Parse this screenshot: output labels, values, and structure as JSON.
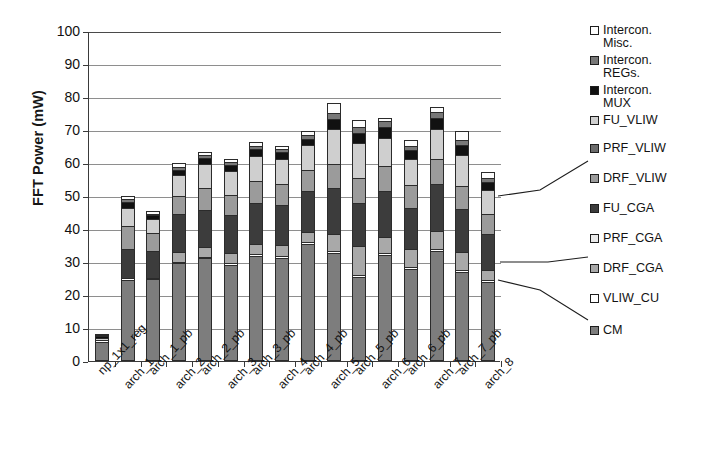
{
  "chart_data": {
    "type": "bar",
    "stacked": true,
    "title": "",
    "xlabel": "",
    "ylabel": "FFT Power (mW)",
    "ylim": [
      0,
      100
    ],
    "ytick_step": 10,
    "ytick_labels": [
      "100",
      "90",
      "80",
      "70",
      "60",
      "50",
      "40",
      "30",
      "20",
      "10",
      "0"
    ],
    "grid": "horizontal",
    "legend_position": "right",
    "categories": [
      "np_1x1_reg",
      "arch_1",
      "arch_1_pb",
      "arch_2",
      "arch_2_pb",
      "arch_3",
      "arch_3_pb",
      "arch_4",
      "arch_4_pb",
      "arch_5",
      "arch_5_pb",
      "arch_6",
      "arch_6_pb",
      "arch_7",
      "arch_7_pb",
      "arch_8"
    ],
    "totals": [
      7.0,
      49.4,
      44.8,
      59.3,
      62.7,
      60.6,
      65.7,
      64.5,
      69.0,
      77.5,
      72.4,
      73.2,
      66.5,
      76.3,
      69.2,
      56.8
    ],
    "series": [
      {
        "name": "CM",
        "color": "#7d7d7d",
        "values": [
          5.2,
          24.0,
          24.2,
          29.0,
          30.5,
          28.6,
          31.2,
          30.7,
          35.0,
          32.2,
          25.0,
          31.6,
          27.4,
          32.8,
          26.4,
          23.4
        ]
      },
      {
        "name": "VLIW_CU",
        "color": "#ffffff",
        "values": [
          0.6,
          0.5,
          0.5,
          0.5,
          0.5,
          0.5,
          0.5,
          0.5,
          0.5,
          0.5,
          0.5,
          0.5,
          0.5,
          0.5,
          0.5,
          0.5
        ]
      },
      {
        "name": "DRF_CGA",
        "color": "#a9a9a9",
        "values": [
          0.0,
          0.0,
          0.0,
          3.0,
          2.9,
          3.0,
          3.3,
          3.3,
          3.0,
          5.2,
          8.6,
          5.0,
          5.4,
          5.4,
          5.6,
          3.1
        ]
      },
      {
        "name": "PRF_CGA",
        "color": "#eaeaea",
        "values": [
          0.0,
          0.0,
          0.0,
          0.0,
          0.0,
          0.0,
          0.0,
          0.0,
          0.0,
          0.0,
          0.0,
          0.0,
          0.0,
          0.0,
          0.0,
          0.0
        ]
      },
      {
        "name": "FU_CGA",
        "color": "#3c3c3c",
        "values": [
          0.0,
          8.8,
          8.0,
          11.4,
          11.4,
          11.6,
          12.4,
          12.3,
          12.4,
          13.9,
          13.2,
          13.8,
          12.6,
          14.2,
          12.9,
          11.0
        ]
      },
      {
        "name": "DRF_VLIW",
        "color": "#9b9b9b",
        "values": [
          0.0,
          7.0,
          5.4,
          5.6,
          6.4,
          6.0,
          6.6,
          6.4,
          6.4,
          7.4,
          7.6,
          7.6,
          6.8,
          7.8,
          7.0,
          5.9
        ]
      },
      {
        "name": "PRF_VLIW",
        "color": "#6b6b6b",
        "values": [
          0.0,
          0.0,
          0.0,
          0.0,
          0.0,
          0.0,
          0.0,
          0.0,
          0.0,
          0.0,
          0.0,
          0.0,
          0.0,
          0.0,
          0.0,
          0.0
        ]
      },
      {
        "name": "FU_VLIW",
        "color": "#cfcfcf",
        "values": [
          0.7,
          5.6,
          4.2,
          6.2,
          7.4,
          7.3,
          7.6,
          7.5,
          7.5,
          10.4,
          10.6,
          8.6,
          8.0,
          9.0,
          9.4,
          7.4
        ]
      },
      {
        "name": "Intercon. MUX",
        "color": "#111111",
        "values": [
          0.3,
          1.6,
          1.2,
          1.6,
          1.8,
          1.8,
          2.0,
          2.0,
          2.0,
          3.2,
          3.0,
          3.2,
          2.6,
          3.4,
          3.0,
          2.4
        ]
      },
      {
        "name": "Intercon. REGs.",
        "color": "#787878",
        "values": [
          0.1,
          0.9,
          0.6,
          0.9,
          1.0,
          1.0,
          1.1,
          1.1,
          1.1,
          1.8,
          1.7,
          1.8,
          1.4,
          1.9,
          1.7,
          1.3
        ]
      },
      {
        "name": "Intercon. Misc.",
        "color": "#fdfdfd",
        "values": [
          0.1,
          1.0,
          0.7,
          1.1,
          0.8,
          0.8,
          1.0,
          0.7,
          1.1,
          2.9,
          2.2,
          1.1,
          1.8,
          1.3,
          2.7,
          1.8
        ]
      }
    ]
  },
  "legend": {
    "items": [
      {
        "label": "Intercon.\nMisc.",
        "swatch": "f-misc"
      },
      {
        "label": "Intercon.\nREGs.",
        "swatch": "f-regs"
      },
      {
        "label": "Intercon.\nMUX",
        "swatch": "f-mux"
      },
      {
        "label": "FU_VLIW",
        "swatch": "f-fuvliw"
      },
      {
        "label": "PRF_VLIW",
        "swatch": "f-prfvliw"
      },
      {
        "label": "DRF_VLIW",
        "swatch": "f-drfvliw"
      },
      {
        "label": "FU_CGA",
        "swatch": "f-fucga"
      },
      {
        "label": "PRF_CGA",
        "swatch": "f-prfcga"
      },
      {
        "label": "DRF_CGA",
        "swatch": "f-drfcga"
      },
      {
        "label": "VLIW_CU",
        "swatch": "f-vliwcu"
      },
      {
        "label": "CM",
        "swatch": "f-cm"
      }
    ]
  },
  "axis": {
    "y_title": "FFT Power (mW)"
  },
  "colors": {
    "axis": "#3a3a3a",
    "grid": "#8e8e8e",
    "text": "#131313",
    "background": "#ffffff"
  }
}
